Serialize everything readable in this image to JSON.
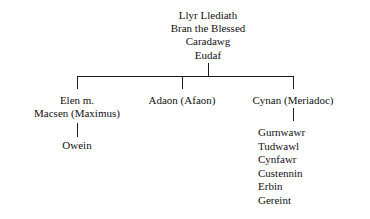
{
  "diagram": {
    "title_lineage": {
      "names": [
        "Llyr Llediath",
        "Bran the Blessed",
        "Caradawg",
        "Eudaf"
      ]
    },
    "branches": {
      "left": {
        "line1": "Elen m.",
        "line2": "Macsen (Maximus)",
        "child": "Owein"
      },
      "center": {
        "label": "Adaon (Afaon)"
      },
      "right": {
        "label": "Cynan (Meriadoc)",
        "children": [
          "Gurnwawr",
          "Tudwawl",
          "Cynfawr",
          "Custennin",
          "Erbin",
          "Gereint"
        ]
      }
    },
    "style": {
      "line_color": "#1a1a1a",
      "text_color": "#111111",
      "background": "#ffffff"
    }
  }
}
